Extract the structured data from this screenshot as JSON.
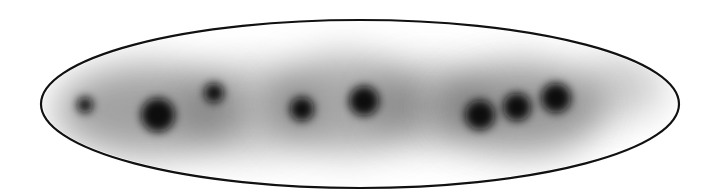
{
  "diagram": {
    "colors": {
      "background": "#ffffff",
      "outline": "#111111",
      "blob": "#0a0a0a",
      "halo": "#555555"
    },
    "ellipse": {
      "cx": 360,
      "cy": 104,
      "rx": 319,
      "ry": 84,
      "stroke_width": 2.2
    },
    "halos": [
      {
        "cx": 150,
        "cy": 110,
        "rx": 95,
        "ry": 45,
        "opacity": 0.55
      },
      {
        "cx": 250,
        "cy": 110,
        "rx": 70,
        "ry": 45,
        "opacity": 0.35
      },
      {
        "cx": 345,
        "cy": 104,
        "rx": 80,
        "ry": 48,
        "opacity": 0.5
      },
      {
        "cx": 430,
        "cy": 105,
        "rx": 60,
        "ry": 40,
        "opacity": 0.4
      },
      {
        "cx": 520,
        "cy": 108,
        "rx": 85,
        "ry": 45,
        "opacity": 0.6
      },
      {
        "cx": 620,
        "cy": 88,
        "rx": 45,
        "ry": 30,
        "opacity": 0.3
      }
    ],
    "blobs": [
      {
        "cx": 85,
        "cy": 105,
        "r": 8
      },
      {
        "cx": 158,
        "cy": 115,
        "r": 17
      },
      {
        "cx": 214,
        "cy": 93,
        "r": 10
      },
      {
        "cx": 302,
        "cy": 109,
        "r": 12
      },
      {
        "cx": 364,
        "cy": 101,
        "r": 15
      },
      {
        "cx": 480,
        "cy": 115,
        "r": 15
      },
      {
        "cx": 517,
        "cy": 107,
        "r": 14
      },
      {
        "cx": 556,
        "cy": 98,
        "r": 15
      }
    ]
  }
}
